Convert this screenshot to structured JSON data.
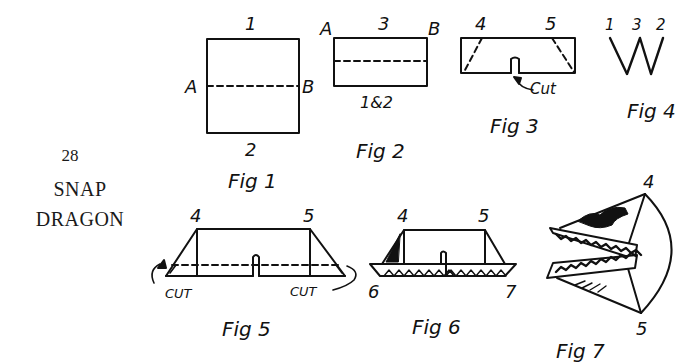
{
  "page": {
    "number": "28",
    "title_lines": [
      "SNAP",
      "DRAGON"
    ]
  },
  "figures": {
    "fig1": {
      "caption": "Fig 1",
      "labels": {
        "top": "1",
        "bottom": "2",
        "left": "A",
        "right": "B"
      }
    },
    "fig2": {
      "caption": "Fig 2",
      "labels": {
        "top": "3",
        "bottom": "1&2",
        "left": "A",
        "right": "B"
      }
    },
    "fig3": {
      "caption": "Fig 3",
      "labels": {
        "left": "4",
        "right": "5",
        "cut": "Cut"
      }
    },
    "fig4": {
      "caption": "Fig 4",
      "labels": {
        "a": "1",
        "b": "3",
        "c": "2"
      }
    },
    "fig5": {
      "caption": "Fig 5",
      "labels": {
        "left": "4",
        "right": "5",
        "cut_left": "CUT",
        "cut_right": "CUT"
      }
    },
    "fig6": {
      "caption": "Fig 6",
      "labels": {
        "top_left": "4",
        "top_right": "5",
        "bottom_left": "6",
        "bottom_right": "7"
      }
    },
    "fig7": {
      "caption": "Fig 7",
      "labels": {
        "top": "4",
        "bottom": "5"
      }
    }
  },
  "colors": {
    "ink": "#111111",
    "paper": "#ffffff"
  }
}
